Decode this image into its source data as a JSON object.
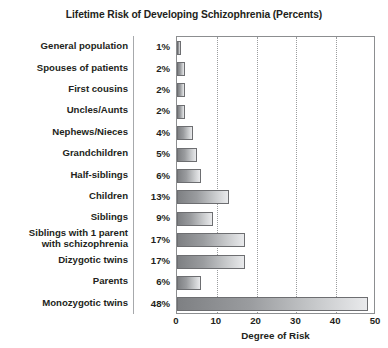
{
  "chart_data": {
    "type": "bar",
    "orientation": "horizontal",
    "title": "Lifetime Risk of Developing Schizophrenia (Percents)",
    "xlabel": "Degree of Risk",
    "ylabel": "",
    "xlim": [
      0,
      50
    ],
    "xticks": [
      0,
      10,
      20,
      30,
      40,
      50
    ],
    "xtick_labels": [
      "0",
      "10",
      "20",
      "30",
      "40",
      "50"
    ],
    "grid": "vertical-dotted",
    "legend": "none",
    "categories": [
      "General population",
      "Spouses of patients",
      "First cousins",
      "Uncles/Aunts",
      "Nephews/Nieces",
      "Grandchildren",
      "Half-siblings",
      "Children",
      "Siblings",
      "Siblings with 1 parent with schizophrenia",
      "Dizygotic twins",
      "Parents",
      "Monozygotic twins"
    ],
    "values": [
      1,
      2,
      2,
      2,
      4,
      5,
      6,
      13,
      9,
      17,
      17,
      6,
      48
    ],
    "value_labels": [
      "1%",
      "2%",
      "2%",
      "2%",
      "4%",
      "5%",
      "6%",
      "13%",
      "9%",
      "17%",
      "17%",
      "6%",
      "48%"
    ]
  },
  "rows": [
    {
      "label_line1": "General population",
      "label_line2": "",
      "pct": "1%",
      "value": 1
    },
    {
      "label_line1": "Spouses of patients",
      "label_line2": "",
      "pct": "2%",
      "value": 2
    },
    {
      "label_line1": "First cousins",
      "label_line2": "",
      "pct": "2%",
      "value": 2
    },
    {
      "label_line1": "Uncles/Aunts",
      "label_line2": "",
      "pct": "2%",
      "value": 2
    },
    {
      "label_line1": "Nephews/Nieces",
      "label_line2": "",
      "pct": "4%",
      "value": 4
    },
    {
      "label_line1": "Grandchildren",
      "label_line2": "",
      "pct": "5%",
      "value": 5
    },
    {
      "label_line1": "Half-siblings",
      "label_line2": "",
      "pct": "6%",
      "value": 6
    },
    {
      "label_line1": "Children",
      "label_line2": "",
      "pct": "13%",
      "value": 13
    },
    {
      "label_line1": "Siblings",
      "label_line2": "",
      "pct": "9%",
      "value": 9
    },
    {
      "label_line1": "Siblings with 1 parent",
      "label_line2": "with schizophrenia",
      "pct": "17%",
      "value": 17
    },
    {
      "label_line1": "Dizygotic twins",
      "label_line2": "",
      "pct": "17%",
      "value": 17
    },
    {
      "label_line1": "Parents",
      "label_line2": "",
      "pct": "6%",
      "value": 6
    },
    {
      "label_line1": "Monozygotic twins",
      "label_line2": "",
      "pct": "48%",
      "value": 48
    }
  ],
  "colors": {
    "bar_dark": "#7e8083",
    "bar_light": "#e9eaec",
    "bar_border": "#6d6e71",
    "plot_border": "#8c8e90",
    "gridline": "#9a9c9e",
    "text": "#231f20",
    "background": "#ffffff"
  }
}
